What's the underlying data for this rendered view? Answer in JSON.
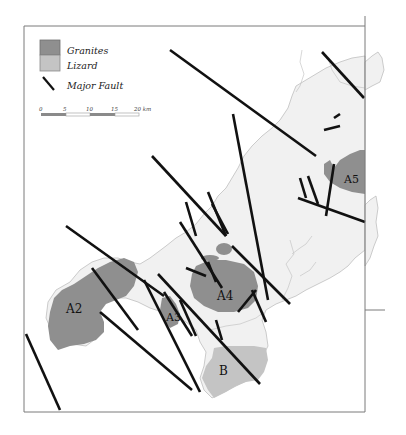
{
  "legend": {
    "granites_label": "Granites",
    "lizard_label": "Lizard",
    "fault_label": "Major Fault"
  },
  "scale_bar": {
    "ticks": [
      "0",
      "5",
      "10",
      "15",
      "20 km"
    ]
  },
  "labels": {
    "a2": "A2",
    "a3": "A3",
    "a4": "A4",
    "a5": "A5",
    "b": "B"
  },
  "colors": {
    "granite": "#8f8f8f",
    "lizard": "#c4c4c4",
    "land": "#f1f1f1",
    "fault": "#111111",
    "frame": "#7a7a7a"
  }
}
